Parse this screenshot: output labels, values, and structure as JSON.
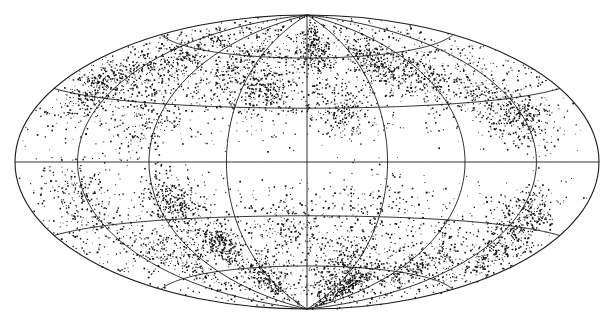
{
  "chart_data": {
    "type": "scatter",
    "projection": "hammer-aitoff",
    "title": "",
    "xlabel": "",
    "ylabel": "",
    "legend": [],
    "grid": true,
    "center_px": [
      307,
      162
    ],
    "radius_px": [
      292,
      147
    ],
    "meridians_deg": [
      -135,
      -90,
      -45,
      0,
      45,
      90,
      135
    ],
    "parallels_deg": [
      -60,
      -30,
      0,
      30,
      60
    ],
    "point_color": "#111111",
    "line_color": "#1a1a1a",
    "background_color": "#ffffff",
    "background_points": 2600,
    "clusters": [
      {
        "lon": -150,
        "lat": 35,
        "spread": 8,
        "n": 320
      },
      {
        "lon": -120,
        "lat": 50,
        "spread": 10,
        "n": 260
      },
      {
        "lon": -100,
        "lat": 20,
        "spread": 10,
        "n": 180
      },
      {
        "lon": -60,
        "lat": 55,
        "spread": 10,
        "n": 220
      },
      {
        "lon": -30,
        "lat": 40,
        "spread": 9,
        "n": 260
      },
      {
        "lon": 10,
        "lat": 65,
        "spread": 8,
        "n": 260
      },
      {
        "lon": 20,
        "lat": 28,
        "spread": 7,
        "n": 180
      },
      {
        "lon": 60,
        "lat": 55,
        "spread": 9,
        "n": 280
      },
      {
        "lon": 90,
        "lat": 45,
        "spread": 10,
        "n": 220
      },
      {
        "lon": 135,
        "lat": 20,
        "spread": 8,
        "n": 260
      },
      {
        "lon": 120,
        "lat": 30,
        "spread": 9,
        "n": 160
      },
      {
        "lon": -140,
        "lat": -15,
        "spread": 10,
        "n": 220
      },
      {
        "lon": -80,
        "lat": -20,
        "spread": 7,
        "n": 300
      },
      {
        "lon": -65,
        "lat": -45,
        "spread": 6,
        "n": 260
      },
      {
        "lon": -50,
        "lat": -65,
        "spread": 8,
        "n": 240
      },
      {
        "lon": -110,
        "lat": -50,
        "spread": 10,
        "n": 200
      },
      {
        "lon": 30,
        "lat": -60,
        "spread": 9,
        "n": 220
      },
      {
        "lon": 60,
        "lat": -70,
        "spread": 8,
        "n": 300
      },
      {
        "lon": 100,
        "lat": -55,
        "spread": 10,
        "n": 220
      },
      {
        "lon": 140,
        "lat": -25,
        "spread": 7,
        "n": 260
      },
      {
        "lon": 150,
        "lat": -45,
        "spread": 8,
        "n": 180
      },
      {
        "lon": 40,
        "lat": -20,
        "spread": 10,
        "n": 120
      },
      {
        "lon": -10,
        "lat": -35,
        "spread": 10,
        "n": 140
      }
    ]
  }
}
